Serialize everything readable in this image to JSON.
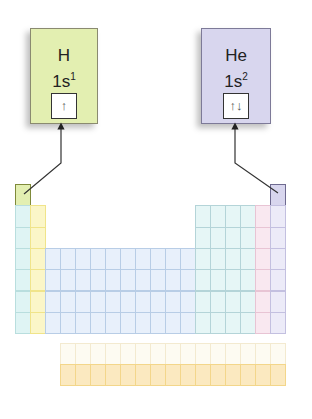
{
  "elements": [
    {
      "symbol": "H",
      "config_base": "1s",
      "config_sup": "1",
      "orbital": "↑",
      "color": "#e3efb1",
      "position": {
        "period": 1,
        "group": 1
      }
    },
    {
      "symbol": "He",
      "config_base": "1s",
      "config_sup": "2",
      "orbital": "↑↓",
      "color": "#d8d6ee",
      "position": {
        "period": 1,
        "group": 18
      }
    }
  ],
  "table": {
    "block_colors": {
      "s1": "#dff4f4",
      "s2": "#fbf6c8",
      "d": "#e8f0fb",
      "p": "#e6f6f6",
      "p_noble_minus1": "#f9e8f0",
      "noble": "#ecebf8",
      "f_top": "#fdfbf2",
      "f_bottom": "#fbe9c0"
    }
  }
}
